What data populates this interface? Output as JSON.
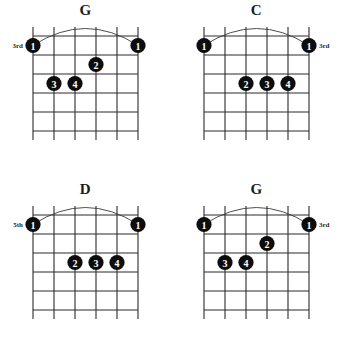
{
  "page": {
    "kind": "guitar-chord-chart",
    "width": 342,
    "height": 358,
    "background": "#ffffff",
    "ink": "#0d0d0d",
    "grid_color": "#2b2b2b",
    "dot_text_color": "#ffffff"
  },
  "grid_spec": {
    "strings": 6,
    "fret_lines": 6,
    "string_labels": [
      "6",
      "5",
      "4",
      "3",
      "2",
      "1"
    ],
    "origin_x": 33,
    "origin_y": 36,
    "string_spacing": 21,
    "fret_spacing": 19,
    "grid_width": 105,
    "grid_height": 95
  },
  "diagrams": [
    {
      "id": "chord-g-3rd-top",
      "title": "G",
      "position": "top-left",
      "fret_label": "3rd",
      "fret_label_side": "left",
      "barre": {
        "fret": 1,
        "from_string": 6,
        "to_string": 1
      },
      "dots": [
        {
          "finger": "1",
          "string": 6,
          "fret": 1
        },
        {
          "finger": "1",
          "string": 1,
          "fret": 1
        },
        {
          "finger": "2",
          "string": 3,
          "fret": 2
        },
        {
          "finger": "3",
          "string": 5,
          "fret": 3
        },
        {
          "finger": "4",
          "string": 4,
          "fret": 3
        }
      ]
    },
    {
      "id": "chord-c-3rd",
      "title": "C",
      "position": "top-right",
      "fret_label": "3rd",
      "fret_label_side": "right",
      "barre": {
        "fret": 1,
        "from_string": 6,
        "to_string": 1
      },
      "dots": [
        {
          "finger": "1",
          "string": 6,
          "fret": 1
        },
        {
          "finger": "1",
          "string": 1,
          "fret": 1
        },
        {
          "finger": "2",
          "string": 4,
          "fret": 3
        },
        {
          "finger": "3",
          "string": 3,
          "fret": 3
        },
        {
          "finger": "4",
          "string": 2,
          "fret": 3
        }
      ]
    },
    {
      "id": "chord-d-5th",
      "title": "D",
      "position": "bottom-left",
      "fret_label": "5th",
      "fret_label_side": "left",
      "barre": {
        "fret": 1,
        "from_string": 6,
        "to_string": 1
      },
      "dots": [
        {
          "finger": "1",
          "string": 6,
          "fret": 1
        },
        {
          "finger": "1",
          "string": 1,
          "fret": 1
        },
        {
          "finger": "2",
          "string": 4,
          "fret": 3
        },
        {
          "finger": "3",
          "string": 3,
          "fret": 3
        },
        {
          "finger": "4",
          "string": 2,
          "fret": 3
        }
      ]
    },
    {
      "id": "chord-g-3rd-bottom",
      "title": "G",
      "position": "bottom-right",
      "fret_label": "3rd",
      "fret_label_side": "right",
      "barre": {
        "fret": 1,
        "from_string": 6,
        "to_string": 1
      },
      "dots": [
        {
          "finger": "1",
          "string": 6,
          "fret": 1
        },
        {
          "finger": "1",
          "string": 1,
          "fret": 1
        },
        {
          "finger": "2",
          "string": 3,
          "fret": 2
        },
        {
          "finger": "3",
          "string": 5,
          "fret": 3
        },
        {
          "finger": "4",
          "string": 4,
          "fret": 3
        }
      ]
    }
  ]
}
